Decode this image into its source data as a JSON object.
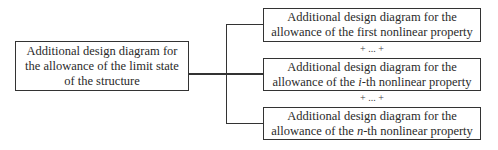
{
  "diagram": {
    "source": {
      "lines": [
        "Additional design diagram for",
        "the allowance of the limit state",
        "of the structure"
      ]
    },
    "targets": [
      {
        "line1": "Additional design diagram for the",
        "line2_prefix": "allowance of the ",
        "line2_var": "",
        "line2_plain": "first",
        "line2_suffix": " nonlinear property"
      },
      {
        "line1": "Additional design diagram for the",
        "line2_prefix": "allowance of the ",
        "line2_var": "i",
        "line2_plain": "",
        "line2_suffix": "-th nonlinear property"
      },
      {
        "line1": "Additional design diagram for the",
        "line2_prefix": "allowance of the ",
        "line2_var": "n",
        "line2_plain": "",
        "line2_suffix": "-th nonlinear property"
      }
    ],
    "separators": [
      "+ ... +",
      "+ ... +"
    ],
    "colors": {
      "stroke": "#333333",
      "text": "#2a2a2a",
      "background": "#ffffff"
    }
  }
}
